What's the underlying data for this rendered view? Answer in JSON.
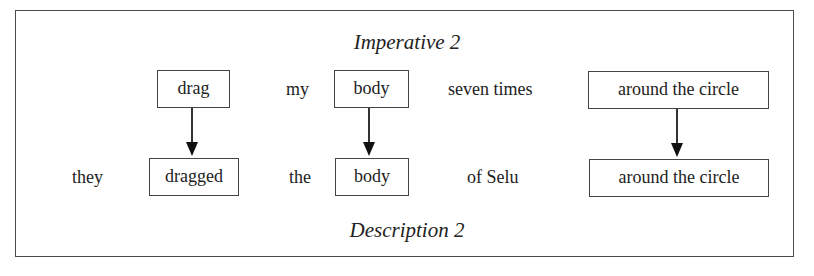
{
  "diagram": {
    "top_title": "Imperative 2",
    "bottom_title": "Description 2",
    "top_row": [
      {
        "text": "drag",
        "boxed": true
      },
      {
        "text": "my",
        "boxed": false
      },
      {
        "text": "body",
        "boxed": true
      },
      {
        "text": "seven times",
        "boxed": false
      },
      {
        "text": "around the circle",
        "boxed": true
      }
    ],
    "bottom_row": [
      {
        "text": "they",
        "boxed": false
      },
      {
        "text": "dragged",
        "boxed": true
      },
      {
        "text": "the",
        "boxed": false
      },
      {
        "text": "body",
        "boxed": true
      },
      {
        "text": "of Selu",
        "boxed": false
      },
      {
        "text": "around the circle",
        "boxed": true
      }
    ],
    "arrows": [
      {
        "from": "drag",
        "to": "dragged"
      },
      {
        "from": "body",
        "to": "body"
      },
      {
        "from": "around the circle",
        "to": "around the circle"
      }
    ]
  }
}
